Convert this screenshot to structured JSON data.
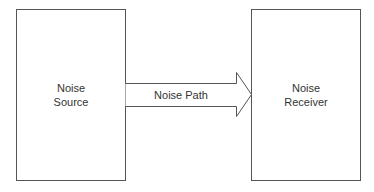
{
  "diagram": {
    "source": {
      "line1": "Noise",
      "line2": "Source"
    },
    "path": {
      "label": "Noise Path"
    },
    "receiver": {
      "line1": "Noise",
      "line2": "Receiver"
    },
    "stroke_color": "#555555"
  }
}
